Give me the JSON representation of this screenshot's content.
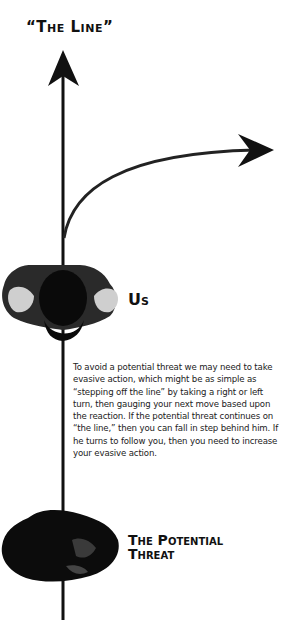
{
  "title": "“The Line”",
  "labels": {
    "us": "Us",
    "threat_line1": "The Potential",
    "threat_line2": "Threat"
  },
  "description": "To avoid a potential threat we may need to take evasive action, which might be as simple as “stepping off the line” by taking a right or left turn, then gauging your next move based upon the reaction. If the potential threat continues on “the line,” then you can fall in step behind him. If he turns to follow you, then you need to increase your evasive action.",
  "figures": {
    "top_figure": "person-us-top-view",
    "bottom_figure": "person-threat-top-view"
  },
  "colors": {
    "line": "#111111",
    "background": "#ffffff"
  }
}
